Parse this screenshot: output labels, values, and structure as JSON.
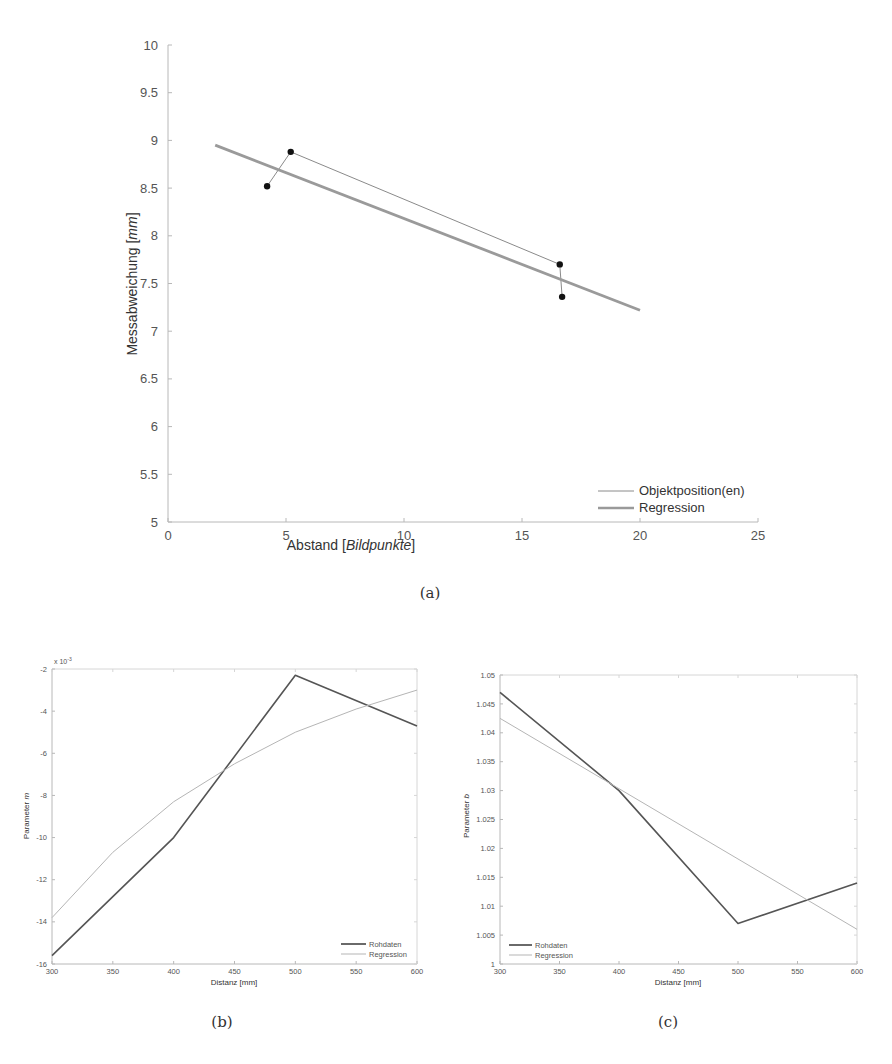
{
  "captions": {
    "a": "(a)",
    "b": "(b)",
    "c": "(c)"
  },
  "chart_data": [
    {
      "id": "a",
      "type": "line",
      "title": "",
      "xlabel": "Abstand [Bildpunkte]",
      "xlabel_plain": "Abstand [",
      "xlabel_italic": "Bildpunkte",
      "xlabel_end": "]",
      "ylabel_plain": "Messabweichung [",
      "ylabel_italic": "mm",
      "ylabel_end": "]",
      "ylabel": "Messabweichung [mm]",
      "xlim": [
        0,
        25
      ],
      "ylim": [
        5,
        10
      ],
      "xticks": [
        "0",
        "5",
        "10",
        "15",
        "20",
        "25"
      ],
      "yticks": [
        "5",
        "5.5",
        "6",
        "6.5",
        "7",
        "7.5",
        "8",
        "8.5",
        "9",
        "9.5",
        "10"
      ],
      "legend_position": "lower right",
      "series": [
        {
          "name": "Objektposition(en)",
          "style": "thin line with dot markers",
          "x": [
            4.2,
            5.2,
            16.6,
            16.7
          ],
          "y": [
            8.52,
            8.88,
            7.7,
            7.36
          ]
        },
        {
          "name": "Regression",
          "style": "thick grey line",
          "x": [
            2,
            20
          ],
          "y": [
            8.95,
            7.22
          ]
        }
      ]
    },
    {
      "id": "b",
      "type": "line",
      "title": "",
      "xlabel": "Distanz [mm]",
      "ylabel": "Parameter m",
      "ylabel_plain": "Parameter ",
      "ylabel_italic": "m",
      "y_exponent": "x 10^-3",
      "xlim": [
        300,
        600
      ],
      "ylim": [
        -16,
        -2
      ],
      "xticks": [
        "300",
        "350",
        "400",
        "450",
        "500",
        "550",
        "600"
      ],
      "yticks": [
        "-16",
        "-14",
        "-12",
        "-10",
        "-8",
        "-6",
        "-4",
        "-2"
      ],
      "legend_position": "lower right",
      "series": [
        {
          "name": "Rohdaten",
          "x": [
            300,
            400,
            500,
            600
          ],
          "y": [
            -15.6,
            -10.0,
            -2.3,
            -4.7
          ]
        },
        {
          "name": "Regression",
          "x": [
            300,
            350,
            400,
            450,
            500,
            550,
            600
          ],
          "y": [
            -13.8,
            -10.7,
            -8.3,
            -6.5,
            -5.0,
            -3.9,
            -3.0
          ]
        }
      ]
    },
    {
      "id": "c",
      "type": "line",
      "title": "",
      "xlabel": "Distanz [mm]",
      "ylabel": "Parameter b",
      "ylabel_plain": "Parameter ",
      "ylabel_italic": "b",
      "xlim": [
        300,
        600
      ],
      "ylim": [
        1,
        1.05
      ],
      "xticks": [
        "300",
        "350",
        "400",
        "450",
        "500",
        "550",
        "600"
      ],
      "yticks": [
        "1",
        "1.005",
        "1.01",
        "1.015",
        "1.02",
        "1.025",
        "1.03",
        "1.035",
        "1.04",
        "1.045",
        "1.05"
      ],
      "legend_position": "lower left",
      "series": [
        {
          "name": "Rohdaten",
          "x": [
            300,
            400,
            500,
            600
          ],
          "y": [
            1.047,
            1.03,
            1.007,
            1.014
          ]
        },
        {
          "name": "Regression",
          "x": [
            300,
            600
          ],
          "y": [
            1.0425,
            1.006
          ]
        }
      ]
    }
  ],
  "colors": {
    "axis": "#b8b8b8",
    "objekt_line": "#8a8a8a",
    "marker": "#111111",
    "regression_a": "#9a9a9a",
    "rohdaten": "#555555",
    "regression_bc": "#b5b5b5"
  }
}
